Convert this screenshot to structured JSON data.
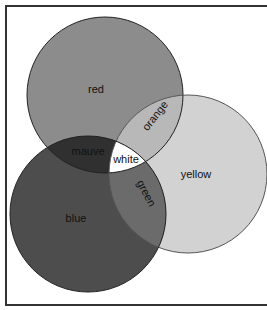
{
  "diagram": {
    "type": "venn",
    "frame": {
      "x": 6,
      "y": 6,
      "width": 270,
      "height": 299,
      "stroke": "#333333"
    },
    "circles": [
      {
        "id": "red",
        "label": "red",
        "cx": 105,
        "cy": 95,
        "r": 78,
        "fill": "#8c8c8c",
        "label_x": 96,
        "label_y": 93
      },
      {
        "id": "yellow",
        "label": "yellow",
        "cx": 188,
        "cy": 174,
        "r": 79,
        "fill": "#d2d2d2",
        "label_x": 196,
        "label_y": 178
      },
      {
        "id": "blue",
        "label": "blue",
        "cx": 88,
        "cy": 214,
        "r": 78,
        "fill": "#4d4d4d",
        "label_x": 76,
        "label_y": 222
      }
    ],
    "regions": [
      {
        "id": "orange",
        "label": "orange",
        "sets": [
          "red",
          "yellow"
        ],
        "fill": "#b8b8b8",
        "label_x": 158,
        "label_y": 118,
        "rotate": -52
      },
      {
        "id": "mauve",
        "label": "mauve",
        "sets": [
          "red",
          "blue"
        ],
        "fill": "#303030",
        "label_x": 88,
        "label_y": 155,
        "rotate": 0
      },
      {
        "id": "green",
        "label": "green",
        "sets": [
          "blue",
          "yellow"
        ],
        "fill": "#6b6b6b",
        "label_x": 143,
        "label_y": 195,
        "rotate": 62
      },
      {
        "id": "white",
        "label": "white",
        "sets": [
          "red",
          "yellow",
          "blue"
        ],
        "fill": "#ffffff",
        "label_x": 126,
        "label_y": 163,
        "rotate": 0
      }
    ]
  }
}
